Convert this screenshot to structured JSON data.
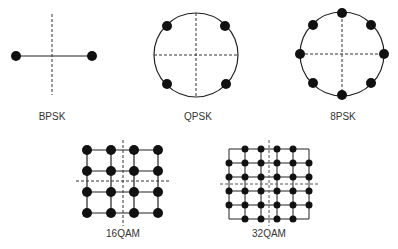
{
  "diagram": {
    "type": "modulation-constellations",
    "colors": {
      "stroke": "#222222",
      "dot": "#111111",
      "dash": "#333333",
      "label": "#333333"
    },
    "panels": [
      {
        "id": "bpsk",
        "label": "BPSK",
        "points": 2
      },
      {
        "id": "qpsk",
        "label": "QPSK",
        "points": 4
      },
      {
        "id": "8psk",
        "label": "8PSK",
        "points": 8
      },
      {
        "id": "16qam",
        "label": "16QAM",
        "points": 16
      },
      {
        "id": "32qam",
        "label": "32QAM",
        "points": 32
      }
    ]
  }
}
